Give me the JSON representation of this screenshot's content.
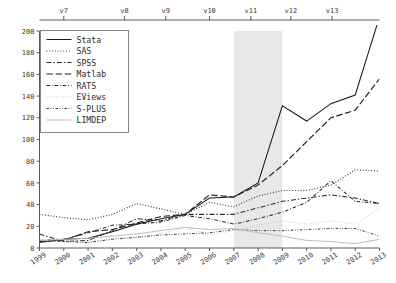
{
  "chart_data": {
    "type": "line",
    "title": "",
    "subtitle": "",
    "xlabel": "",
    "ylabel": "",
    "x": [
      1999,
      2000,
      2001,
      2002,
      2003,
      2004,
      2005,
      2006,
      2007,
      2008,
      2009,
      2010,
      2011,
      2012,
      2013
    ],
    "xtick_labels": [
      "1999",
      "2000",
      "2001",
      "2002",
      "2003",
      "2004",
      "2005",
      "2006",
      "2007",
      "2008",
      "2009",
      "2010",
      "2011",
      "2012",
      "2013"
    ],
    "ytick_labels": [
      "0",
      "20",
      "40",
      "60",
      "80",
      "100",
      "120",
      "140",
      "160",
      "180",
      "200"
    ],
    "ylim": [
      0,
      200
    ],
    "xlim": [
      1999,
      2013
    ],
    "grid": false,
    "legend_position": "top-left",
    "top_axis": {
      "label": "",
      "ticks": [
        {
          "label": "v7",
          "x": 2000
        },
        {
          "label": "v8",
          "x": 2002.5
        },
        {
          "label": "v9",
          "x": 2004.2
        },
        {
          "label": "v10",
          "x": 2006.0
        },
        {
          "label": "v11",
          "x": 2007.7
        },
        {
          "label": "v12",
          "x": 2009.35
        },
        {
          "label": "v13",
          "x": 2011.05
        }
      ]
    },
    "shaded_region": {
      "label": "",
      "x_start": 2007,
      "x_end": 2009,
      "color": "#e8e8e8"
    },
    "series": [
      {
        "name": "Stata",
        "style": "solid",
        "color": "#1a1a1a",
        "values": [
          5,
          8,
          9,
          15,
          22,
          27,
          31,
          46,
          47,
          60,
          131,
          117,
          133,
          141,
          213
        ]
      },
      {
        "name": "SAS",
        "style": "dotted",
        "color": "#2b2b2b",
        "values": [
          31,
          28,
          26,
          31,
          41,
          36,
          31,
          42,
          38,
          48,
          53,
          53,
          58,
          72,
          71
        ]
      },
      {
        "name": "SPSS",
        "style": "dashdot",
        "color": "#2b2b2b",
        "values": [
          13,
          6,
          7,
          16,
          27,
          25,
          31,
          31,
          31,
          37,
          43,
          46,
          49,
          46,
          41
        ]
      },
      {
        "name": "Matlab",
        "style": "longdash",
        "color": "#1f1f1f",
        "values": [
          6,
          7,
          15,
          17,
          23,
          29,
          31,
          49,
          47,
          58,
          76,
          98,
          120,
          127,
          156
        ]
      },
      {
        "name": "RATS",
        "style": "shortdashdot",
        "color": "#2b2b2b",
        "values": [
          7,
          8,
          14,
          21,
          22,
          24,
          30,
          27,
          22,
          27,
          33,
          42,
          62,
          43,
          41
        ]
      },
      {
        "name": "EViews",
        "style": "finedot",
        "color": "#b5b5b5",
        "values": [
          5,
          7,
          6,
          9,
          9,
          13,
          19,
          12,
          16,
          21,
          25,
          22,
          25,
          22,
          37
        ]
      },
      {
        "name": "S-PLUS",
        "style": "dashdotdot",
        "color": "#3a3a3a",
        "values": [
          7,
          6,
          5,
          8,
          10,
          12,
          13,
          14,
          17,
          16,
          16,
          17,
          18,
          18,
          11
        ]
      },
      {
        "name": "LIMDEP",
        "style": "solid-light",
        "color": "#bdbdbd",
        "values": [
          7,
          8,
          9,
          11,
          13,
          16,
          19,
          17,
          18,
          14,
          11,
          7,
          6,
          4,
          8
        ]
      }
    ]
  },
  "legend": {
    "entries": [
      {
        "label": "Stata"
      },
      {
        "label": "SAS"
      },
      {
        "label": "SPSS"
      },
      {
        "label": "Matlab"
      },
      {
        "label": "RATS"
      },
      {
        "label": "EViews"
      },
      {
        "label": "S-PLUS"
      },
      {
        "label": "LIMDEP"
      }
    ]
  }
}
